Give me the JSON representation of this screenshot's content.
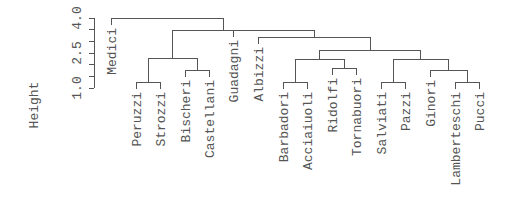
{
  "chart_data": {
    "type": "dendrogram",
    "title": "",
    "xlabel": "",
    "ylabel": "Height",
    "ylim": [
      1.0,
      4.0
    ],
    "y_ticks": [
      1.0,
      1.5,
      2.0,
      2.5,
      3.0,
      3.5,
      4.0
    ],
    "y_tick_labels": [
      "1.0",
      "2.5",
      "4.0"
    ],
    "leaves": [
      "Medici",
      "Peruzzi",
      "Strozzi",
      "Bischeri",
      "Castellani",
      "Guadagni",
      "Albizzi",
      "Barbadori",
      "Acciaiuoli",
      "Ridolfi",
      "Tornabuori",
      "Salviati",
      "Pazzi",
      "Ginori",
      "Lamberteschi",
      "Pucci"
    ],
    "merges": [
      {
        "id": "m1",
        "left": "Peruzzi",
        "right": "Strozzi",
        "height": 1.26
      },
      {
        "id": "m2",
        "left": "Barbadori",
        "right": "Acciaiuoli",
        "height": 1.26
      },
      {
        "id": "m3",
        "left": "Salviati",
        "right": "Pazzi",
        "height": 1.26
      },
      {
        "id": "m4",
        "left": "Lamberteschi",
        "right": "Pucci",
        "height": 1.26
      },
      {
        "id": "m5",
        "left": "Bischeri",
        "right": "Castellani",
        "height": 1.77
      },
      {
        "id": "m6",
        "left": "Ridolfi",
        "right": "Tornabuori",
        "height": 1.77
      },
      {
        "id": "m7",
        "left": "Ginori",
        "right": "m4",
        "height": 1.77
      },
      {
        "id": "m8",
        "left": "m1",
        "right": "m5",
        "height": 2.29
      },
      {
        "id": "m9",
        "left": "m2",
        "right": "m6",
        "height": 2.24
      },
      {
        "id": "m10",
        "left": "m3",
        "right": "m7",
        "height": 2.24
      },
      {
        "id": "m11",
        "left": "m9",
        "right": "m10",
        "height": 2.63
      },
      {
        "id": "m12",
        "left": "Albizzi",
        "right": "m11",
        "height": 3.19
      },
      {
        "id": "m13",
        "left": "Guadagni",
        "right": "m12",
        "height": 3.49
      },
      {
        "id": "m14",
        "left": "m8",
        "right": "m13",
        "height": 3.49
      },
      {
        "id": "m15",
        "left": "Medici",
        "right": "m14",
        "height": 4.0
      }
    ]
  },
  "layout": {
    "leaf_x": {
      "Medici": 111,
      "Peruzzi": 136,
      "Strozzi": 160,
      "Bischeri": 185,
      "Castellani": 209,
      "Guadagni": 233,
      "Albizzi": 258,
      "Barbadori": 283,
      "Acciaiuoli": 307,
      "Ridolfi": 332,
      "Tornabuori": 356,
      "Salviati": 381,
      "Pazzi": 405,
      "Ginori": 430,
      "Lamberteschi": 455,
      "Pucci": 479
    },
    "merge_y": {
      "m1": 82,
      "m2": 82,
      "m3": 82,
      "m4": 82,
      "m5": 70,
      "m6": 68,
      "m7": 70,
      "m8": 58,
      "m9": 59,
      "m10": 59,
      "m11": 50,
      "m12": 37,
      "m13": 30,
      "m14": 30,
      "m15": 18
    },
    "leaf_hang": 7,
    "axis": {
      "x": 94,
      "y_top": 18,
      "y_bottom": 88,
      "tick_len": 5
    },
    "tick_y": [
      88,
      76.3,
      64.7,
      53,
      41.3,
      29.7,
      18
    ],
    "tick_label_y": {
      "1.0": 88,
      "2.5": 53,
      "4.0": 18
    },
    "ylabel_pos": {
      "x": 38,
      "y": 105
    }
  }
}
